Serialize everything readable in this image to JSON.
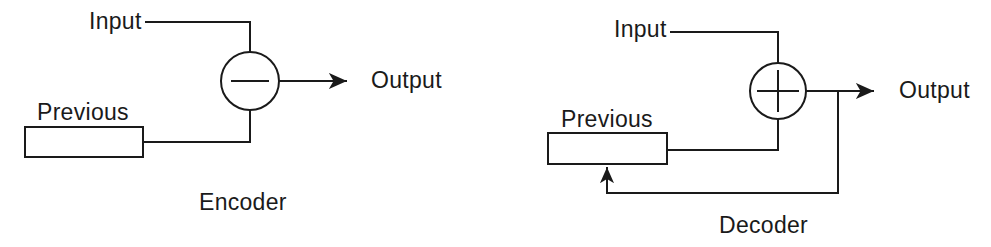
{
  "figure": {
    "background_color": "#ffffff",
    "stroke_color": "#1a1a1a",
    "stroke_width": 2
  },
  "encoder": {
    "caption": "Encoder",
    "input_label": "Input",
    "previous_label": "Previous",
    "output_label": "Output",
    "operator": "minus",
    "operator_symbol": "−",
    "signal_flow": "Input and Previous feed a summing junction that subtracts Previous from Input, producing Output"
  },
  "decoder": {
    "caption": "Decoder",
    "input_label": "Input",
    "previous_label": "Previous",
    "output_label": "Output",
    "operator": "plus",
    "operator_symbol": "+",
    "signal_flow": "Input and Previous feed a summing junction that adds them, producing Output which is fed back into the Previous block"
  },
  "diagram_geometry": {
    "encoder": {
      "junction_center": [
        250,
        81
      ],
      "junction_radius": 29,
      "previous_box": [
        25,
        127,
        118,
        30
      ],
      "output_arrow": [
        280,
        81,
        348,
        81
      ]
    },
    "decoder": {
      "junction_center": [
        778,
        91
      ],
      "junction_radius": 28,
      "previous_box": [
        548,
        133,
        119,
        31
      ],
      "output_arrow": [
        806,
        91,
        875,
        91
      ],
      "feedback_tap_x": 838,
      "feedback_bottom_y": 193,
      "feedback_arrow_x": 607
    }
  }
}
